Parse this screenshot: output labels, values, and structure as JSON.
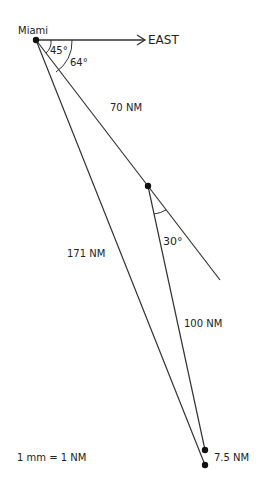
{
  "diagram": {
    "points": {
      "miami": {
        "label": "Miami",
        "x": 36,
        "y": 40
      },
      "turn": {
        "x": 148,
        "y": 186
      },
      "end_upper": {
        "x": 205,
        "y": 450
      },
      "end_lower": {
        "x": 205,
        "y": 465
      }
    },
    "labels": {
      "miami": "Miami",
      "east": "EAST",
      "angle_45": "45°",
      "angle_64": "64°",
      "leg1": "70 NM",
      "leg2": "100 NM",
      "direct": "171 NM",
      "angle_30": "30°",
      "offset": "7.5 NM",
      "scale": "1 mm = 1 NM"
    },
    "colors": {
      "line": "#333333",
      "dot": "#111111"
    }
  }
}
